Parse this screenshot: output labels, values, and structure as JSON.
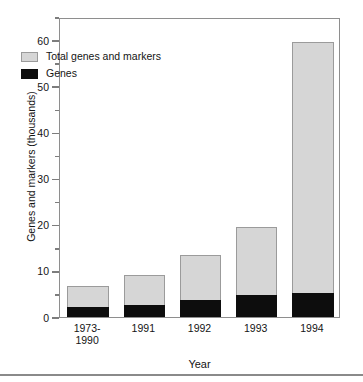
{
  "chart_data": {
    "type": "bar",
    "title": "",
    "subtitle": "",
    "xlabel": "Year",
    "ylabel": "Genes and markers (thousands)",
    "categories": [
      "1973-\n1990",
      "1991",
      "1992",
      "1993",
      "1994"
    ],
    "category_lines": [
      [
        "1973-",
        "1990"
      ],
      [
        "1991"
      ],
      [
        "1992"
      ],
      [
        "1993"
      ],
      [
        "1994"
      ]
    ],
    "series": [
      {
        "name": "Total genes and markers",
        "color": "#d6d6d6",
        "values": [
          6.8,
          9.0,
          13.5,
          19.5,
          59.6
        ]
      },
      {
        "name": "Genes",
        "color": "#0d0d0d",
        "values": [
          2.2,
          2.6,
          3.7,
          4.8,
          5.2
        ]
      }
    ],
    "ylim": [
      0,
      65
    ],
    "yticks": [
      0,
      10,
      20,
      30,
      40,
      50,
      60
    ],
    "ytick_labels": [
      "0",
      "10",
      "20",
      "30",
      "40",
      "50",
      "60"
    ],
    "yticks_minor": [
      5,
      15,
      25,
      35,
      45,
      55,
      65
    ],
    "grid": false,
    "legend_position": "upper-left-inside",
    "bar_overlay": "overlaid",
    "frame_color": "#8e8e8e"
  },
  "axes": {
    "y_title": "Genes and markers (thousands)",
    "x_title": "Year"
  },
  "legend": {
    "entries": [
      {
        "label": "Total genes and markers",
        "swatch": "total"
      },
      {
        "label": "Genes",
        "swatch": "genes"
      }
    ]
  }
}
